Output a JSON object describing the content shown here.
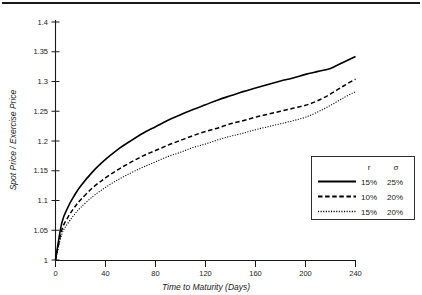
{
  "chart_data": {
    "type": "line",
    "title": "",
    "xlabel": "Time to Maturity (Days)",
    "ylabel": "Spot Price / Exercise Price",
    "xlim": [
      0,
      240
    ],
    "ylim": [
      1,
      1.4
    ],
    "grid": false,
    "legend_position": "right-middle",
    "xticks": [
      "0",
      "40",
      "80",
      "120",
      "160",
      "200",
      "240"
    ],
    "xtick_values": [
      0,
      40,
      80,
      120,
      160,
      200,
      240
    ],
    "yticks": [
      "1",
      "1.05",
      "1.1",
      "1.15",
      "1.2",
      "1.25",
      "1.3",
      "1.35",
      "1.4"
    ],
    "ytick_values": [
      1,
      1.05,
      1.1,
      1.15,
      1.2,
      1.25,
      1.3,
      1.35,
      1.4
    ],
    "x": [
      0,
      5,
      10,
      15,
      20,
      30,
      40,
      50,
      60,
      70,
      80,
      90,
      100,
      110,
      120,
      130,
      140,
      150,
      160,
      170,
      180,
      190,
      200,
      210,
      220,
      230,
      240
    ],
    "series": [
      {
        "name": "15% 25%",
        "style": "solid",
        "r": "15%",
        "sigma": "25%",
        "values": [
          1.0,
          1.062,
          1.089,
          1.108,
          1.124,
          1.149,
          1.169,
          1.186,
          1.2,
          1.213,
          1.224,
          1.235,
          1.244,
          1.253,
          1.261,
          1.269,
          1.276,
          1.283,
          1.289,
          1.295,
          1.301,
          1.306,
          1.312,
          1.317,
          1.322,
          1.332,
          1.342
        ]
      },
      {
        "name": "10% 20%",
        "style": "dashed",
        "r": "10%",
        "sigma": "20%",
        "values": [
          1.0,
          1.05,
          1.072,
          1.088,
          1.101,
          1.122,
          1.138,
          1.152,
          1.164,
          1.175,
          1.184,
          1.193,
          1.201,
          1.209,
          1.216,
          1.222,
          1.229,
          1.234,
          1.24,
          1.245,
          1.25,
          1.255,
          1.26,
          1.268,
          1.279,
          1.292,
          1.304
        ]
      },
      {
        "name": "15% 20%",
        "style": "dotted",
        "r": "15%",
        "sigma": "20%",
        "values": [
          1.0,
          1.043,
          1.062,
          1.076,
          1.088,
          1.107,
          1.122,
          1.135,
          1.146,
          1.156,
          1.165,
          1.174,
          1.181,
          1.189,
          1.195,
          1.202,
          1.208,
          1.213,
          1.219,
          1.224,
          1.229,
          1.234,
          1.24,
          1.249,
          1.26,
          1.272,
          1.283
        ]
      }
    ]
  },
  "legend": {
    "header_r": "r",
    "header_sigma": "σ",
    "rows": [
      {
        "r": "15%",
        "sigma": "25%",
        "style": "solid"
      },
      {
        "r": "10%",
        "sigma": "20%",
        "style": "dashed"
      },
      {
        "r": "15%",
        "sigma": "20%",
        "style": "dotted"
      }
    ]
  },
  "axes": {
    "x_title": "Time to Maturity (Days)",
    "y_title": "Spot Price / Exercise Price"
  }
}
